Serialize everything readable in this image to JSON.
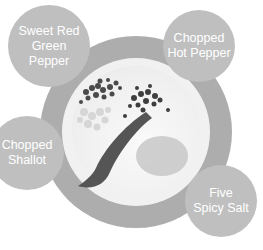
{
  "diagram": {
    "title": "",
    "center": {
      "label": "plate-with-ingredients",
      "ring_color": "#adadad",
      "plate_color": "#f1f1f1"
    },
    "bubbles": [
      {
        "id": "sweet-red-green-pepper",
        "lines": [
          "Sweet Red",
          "Green",
          "Pepper"
        ]
      },
      {
        "id": "chopped-hot-pepper",
        "lines": [
          "Chopped",
          "Hot Pepper"
        ]
      },
      {
        "id": "chopped-shallot",
        "lines": [
          "Chopped",
          "Shallot"
        ]
      },
      {
        "id": "five-spicy-salt",
        "lines": [
          "Five",
          "Spicy Salt"
        ]
      }
    ],
    "bubble_color": "#bfbfbf",
    "text_color": "#ffffff"
  }
}
